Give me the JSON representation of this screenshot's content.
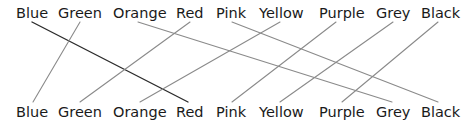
{
  "diagram": {
    "type": "matching-lines",
    "top_row": [
      "Blue",
      "Green",
      "Orange",
      "Red",
      "Pink",
      "Yellow",
      "Purple",
      "Grey",
      "Black"
    ],
    "bottom_row": [
      "Blue",
      "Green",
      "Orange",
      "Red",
      "Pink",
      "Yellow",
      "Purple",
      "Grey",
      "Black"
    ],
    "top_label_x": [
      16,
      58,
      113,
      176,
      216,
      259,
      319,
      376,
      421
    ],
    "bottom_label_x": [
      16,
      58,
      113,
      176,
      216,
      259,
      319,
      376,
      421
    ],
    "top_baseline_y": 18,
    "bottom_baseline_y": 117,
    "connections": [
      {
        "from": "Blue",
        "to": "Red",
        "x1": 32,
        "y1": 22,
        "x2": 188,
        "y2": 102,
        "color": "#2b2b2b",
        "width": 1.4
      },
      {
        "from": "Green",
        "to": "Blue",
        "x1": 80,
        "y1": 22,
        "x2": 33,
        "y2": 102,
        "color": "#8a8a8a",
        "width": 1.1
      },
      {
        "from": "Orange",
        "to": "Grey",
        "x1": 138,
        "y1": 22,
        "x2": 392,
        "y2": 102,
        "color": "#8a8a8a",
        "width": 1.1
      },
      {
        "from": "Red",
        "to": "Green",
        "x1": 190,
        "y1": 22,
        "x2": 80,
        "y2": 102,
        "color": "#8a8a8a",
        "width": 1.1
      },
      {
        "from": "Pink",
        "to": "Black",
        "x1": 232,
        "y1": 22,
        "x2": 438,
        "y2": 102,
        "color": "#8a8a8a",
        "width": 1.1
      },
      {
        "from": "Yellow",
        "to": "Orange",
        "x1": 280,
        "y1": 22,
        "x2": 140,
        "y2": 102,
        "color": "#8a8a8a",
        "width": 1.1
      },
      {
        "from": "Purple",
        "to": "Pink",
        "x1": 336,
        "y1": 22,
        "x2": 232,
        "y2": 102,
        "color": "#8a8a8a",
        "width": 1.1
      },
      {
        "from": "Grey",
        "to": "Yellow",
        "x1": 393,
        "y1": 22,
        "x2": 280,
        "y2": 102,
        "color": "#8a8a8a",
        "width": 1.1
      },
      {
        "from": "Black",
        "to": "Purple",
        "x1": 438,
        "y1": 22,
        "x2": 342,
        "y2": 102,
        "color": "#8a8a8a",
        "width": 1.1
      }
    ],
    "colors": {
      "text": "#1a1a1a",
      "highlight_line": "#2b2b2b",
      "line": "#8a8a8a",
      "background": "#ffffff"
    }
  }
}
